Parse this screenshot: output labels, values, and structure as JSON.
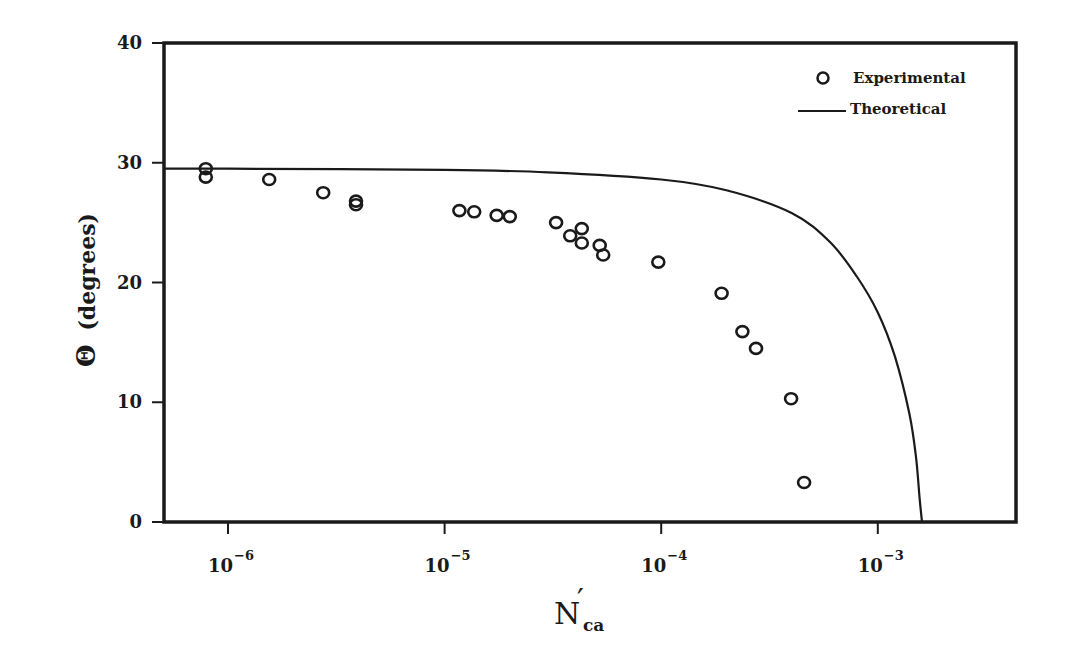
{
  "chart_data": {
    "type": "scatter",
    "title": "",
    "xlabel": "N'ca",
    "xlabel_main": "N",
    "xlabel_prime": "′",
    "xlabel_sub": "ca",
    "ylabel": "Θ (degrees)",
    "ylabel_symbol": "Θ",
    "ylabel_text": "(degrees)",
    "xscale": "log",
    "xlim": [
      5e-07,
      0.005
    ],
    "ylim": [
      0,
      40
    ],
    "grid": false,
    "legend_position": "upper right",
    "x_ticks": [
      {
        "value": 1e-06,
        "base": "10",
        "exp": "-6"
      },
      {
        "value": 1e-05,
        "base": "10",
        "exp": "-5"
      },
      {
        "value": 0.0001,
        "base": "10",
        "exp": "-4"
      },
      {
        "value": 0.001,
        "base": "10",
        "exp": "-3"
      }
    ],
    "y_ticks": [
      0,
      10,
      20,
      30,
      40
    ],
    "series": [
      {
        "name": "Experimental",
        "marker": "open-circle",
        "points": [
          [
            7.9e-07,
            29.5
          ],
          [
            7.9e-07,
            28.8
          ],
          [
            1.55e-06,
            28.6
          ],
          [
            2.75e-06,
            27.5
          ],
          [
            3.9e-06,
            26.8
          ],
          [
            3.9e-06,
            26.5
          ],
          [
            1.17e-05,
            26.0
          ],
          [
            1.37e-05,
            25.9
          ],
          [
            1.74e-05,
            25.6
          ],
          [
            2e-05,
            25.5
          ],
          [
            3.27e-05,
            25.0
          ],
          [
            3.8e-05,
            23.9
          ],
          [
            4.3e-05,
            24.5
          ],
          [
            4.3e-05,
            23.3
          ],
          [
            5.2e-05,
            23.1
          ],
          [
            5.4e-05,
            22.3
          ],
          [
            9.7e-05,
            21.7
          ],
          [
            0.00019,
            19.1
          ],
          [
            0.000237,
            15.9
          ],
          [
            0.000274,
            14.5
          ],
          [
            0.000398,
            10.3
          ],
          [
            0.000457,
            3.3
          ]
        ]
      },
      {
        "name": "Theoretical",
        "marker": "line",
        "points": [
          [
            5e-07,
            29.5
          ],
          [
            1e-06,
            29.5
          ],
          [
            1e-05,
            29.4
          ],
          [
            3e-05,
            29.2
          ],
          [
            0.0001,
            28.6
          ],
          [
            0.0002,
            27.7
          ],
          [
            0.0004,
            25.8
          ],
          [
            0.0006,
            23.4
          ],
          [
            0.0008,
            20.5
          ],
          [
            0.001,
            17.5
          ],
          [
            0.0012,
            13.8
          ],
          [
            0.0014,
            9.0
          ],
          [
            0.0015,
            5.5
          ],
          [
            0.00156,
            2.0
          ],
          [
            0.0016,
            0
          ]
        ]
      }
    ]
  },
  "legend": {
    "items": [
      {
        "label": "Experimental",
        "symbol": "open-circle"
      },
      {
        "label": "Theoretical",
        "symbol": "line"
      }
    ]
  },
  "colors": {
    "ink": "#1a1a1a",
    "background": "#ffffff"
  }
}
